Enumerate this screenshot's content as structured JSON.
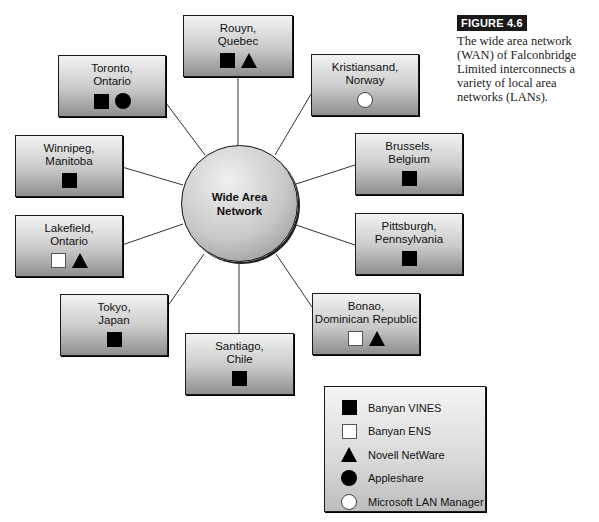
{
  "caption": {
    "label": "FIGURE 4.6",
    "text": "The wide area network (WAN) of Falconbridge Limited interconnects a variety of local area networks (LANs)."
  },
  "hub": {
    "label": "Wide Area Network"
  },
  "nodes": [
    {
      "id": "rouyn",
      "line1": "Rouyn,",
      "line2": "Quebec",
      "systems": [
        "banyan-vines",
        "novell-netware"
      ]
    },
    {
      "id": "toronto",
      "line1": "Toronto,",
      "line2": "Ontario",
      "systems": [
        "banyan-vines",
        "appleshare"
      ]
    },
    {
      "id": "kristiansand",
      "line1": "Kristiansand,",
      "line2": "Norway",
      "systems": [
        "microsoft-lan-manager"
      ]
    },
    {
      "id": "winnipeg",
      "line1": "Winnipeg,",
      "line2": "Manitoba",
      "systems": [
        "banyan-vines"
      ]
    },
    {
      "id": "brussels",
      "line1": "Brussels,",
      "line2": "Belgium",
      "systems": [
        "banyan-vines"
      ]
    },
    {
      "id": "lakefield",
      "line1": "Lakefield,",
      "line2": "Ontario",
      "systems": [
        "banyan-ens",
        "novell-netware"
      ]
    },
    {
      "id": "pittsburgh",
      "line1": "Pittsburgh,",
      "line2": "Pennsylvania",
      "systems": [
        "banyan-vines"
      ]
    },
    {
      "id": "tokyo",
      "line1": "Tokyo,",
      "line2": "Japan",
      "systems": [
        "banyan-vines"
      ]
    },
    {
      "id": "bonao",
      "line1": "Bonao,",
      "line2": "Dominican Republic",
      "systems": [
        "banyan-ens",
        "novell-netware"
      ]
    },
    {
      "id": "santiago",
      "line1": "Santiago,",
      "line2": "Chile",
      "systems": [
        "banyan-vines"
      ]
    }
  ],
  "legend": {
    "items": [
      {
        "symbol": "black-square",
        "label": "Banyan VINES"
      },
      {
        "symbol": "white-square",
        "label": "Banyan ENS"
      },
      {
        "symbol": "black-triangle",
        "label": "Novell NetWare"
      },
      {
        "symbol": "black-circle",
        "label": "Appleshare"
      },
      {
        "symbol": "white-circle",
        "label": "Microsoft LAN Manager"
      }
    ]
  }
}
